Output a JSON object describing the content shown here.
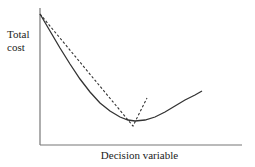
{
  "chart_data": {
    "type": "line",
    "title": "",
    "xlabel": "Decision variable",
    "ylabel": "Total cost",
    "ylabel_lines": [
      "Total",
      "cost"
    ],
    "grid": false,
    "legend": null,
    "ticks": "none",
    "series": [
      {
        "name": "Total cost (actual)",
        "style": "solid",
        "color": "#333333",
        "x": [
          0,
          0.1,
          0.2,
          0.3,
          0.4,
          0.47,
          0.55,
          0.65,
          0.75,
          0.8
        ],
        "y": [
          1.0,
          0.73,
          0.5,
          0.32,
          0.2,
          0.18,
          0.2,
          0.27,
          0.37,
          0.42
        ]
      },
      {
        "name": "Piecewise linear approximation",
        "style": "dashed",
        "color": "#333333",
        "x": [
          0,
          0.46,
          0.53
        ],
        "y": [
          1.0,
          0.14,
          0.36
        ]
      }
    ],
    "pixel_geometry": {
      "y_axis": {
        "x": 40,
        "y_top": 8,
        "y_bottom": 145
      },
      "x_axis": {
        "y": 145,
        "x_left": 40,
        "x_right": 242
      },
      "solid_points": [
        [
          40,
          14
        ],
        [
          50,
          31
        ],
        [
          60,
          48
        ],
        [
          70,
          64
        ],
        [
          80,
          79
        ],
        [
          90,
          92
        ],
        [
          100,
          103
        ],
        [
          110,
          111
        ],
        [
          120,
          117
        ],
        [
          128,
          120
        ],
        [
          135,
          121
        ],
        [
          145,
          120
        ],
        [
          155,
          117
        ],
        [
          165,
          112
        ],
        [
          175,
          106
        ],
        [
          185,
          100
        ],
        [
          195,
          95
        ],
        [
          202,
          91
        ]
      ],
      "dashed_points": [
        [
          40,
          14
        ],
        [
          133,
          126
        ],
        [
          147,
          98
        ]
      ]
    }
  }
}
